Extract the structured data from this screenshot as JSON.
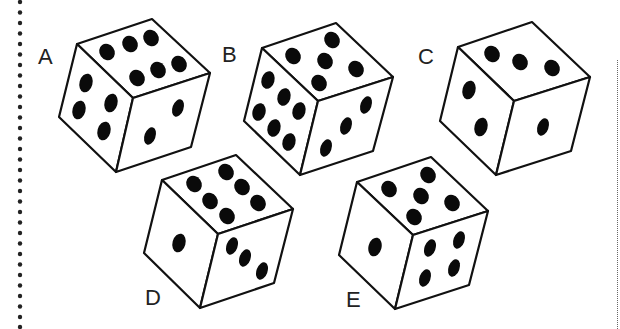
{
  "puzzle": {
    "type": "dice-comparison",
    "dice": [
      {
        "label": "A",
        "faces": {
          "top": 6,
          "left": 4,
          "right": 2
        }
      },
      {
        "label": "B",
        "faces": {
          "top": 5,
          "left": 6,
          "right": 3
        }
      },
      {
        "label": "C",
        "faces": {
          "top": 3,
          "left": 2,
          "right": 1
        }
      },
      {
        "label": "D",
        "faces": {
          "top": 6,
          "left": 1,
          "right": 3
        }
      },
      {
        "label": "E",
        "faces": {
          "top": 5,
          "left": 1,
          "right": 4
        }
      }
    ]
  },
  "colors": {
    "ink": "#111111",
    "background": "#ffffff",
    "pip": "#0a0a0a"
  }
}
